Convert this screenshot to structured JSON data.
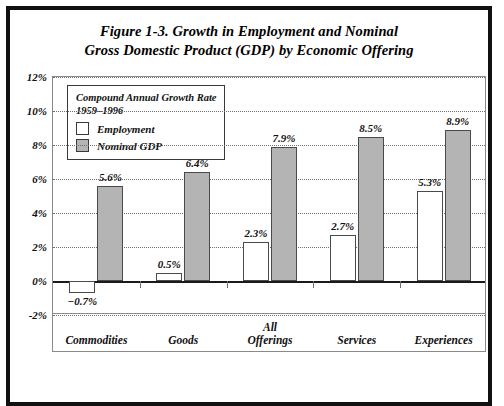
{
  "figure": {
    "title_line1": "Figure 1-3. Growth in Employment and Nominal",
    "title_line2": "Gross Domestic Product (GDP) by Economic Offering"
  },
  "legend": {
    "title_line1": "Compound Annual Growth Rate",
    "title_line2": "1959–1996",
    "entries": [
      {
        "label": "Employment",
        "swatch": "white"
      },
      {
        "label": "Nominal GDP",
        "swatch": "gray"
      }
    ]
  },
  "colors": {
    "employment_fill": "#ffffff",
    "gdp_fill": "#b4b4b4",
    "bar_outline": "#4a4a4a",
    "gridline": "#6f6f6f",
    "axis": "#1a1a1a",
    "frame": "#111111",
    "text": "#111111"
  },
  "chart_data": {
    "type": "bar",
    "title": "Figure 1-3. Growth in Employment and Nominal Gross Domestic Product (GDP) by Economic Offering",
    "subtitle": "Compound Annual Growth Rate 1959–1996",
    "xlabel": "",
    "ylabel": "",
    "ylim": [
      -2,
      12
    ],
    "ytick_step": 2,
    "yticks": [
      "12%",
      "10%",
      "8%",
      "6%",
      "4%",
      "2%",
      "0%",
      "-2%"
    ],
    "ytick_values": [
      12,
      10,
      8,
      6,
      4,
      2,
      0,
      -2
    ],
    "grid": "horizontal-dotted",
    "legend_position": "inside-top-left",
    "categories": [
      "Commodities",
      "Goods",
      "All Offerings",
      "Services",
      "Experiences"
    ],
    "category_lines": [
      [
        "Commodities"
      ],
      [
        "Goods"
      ],
      [
        "All",
        "Offerings"
      ],
      [
        "Services"
      ],
      [
        "Experiences"
      ]
    ],
    "series": [
      {
        "name": "Employment",
        "values": [
          -0.7,
          0.5,
          2.3,
          2.7,
          5.3
        ],
        "labels": [
          "−0.7%",
          "0.5%",
          "2.3%",
          "2.7%",
          "5.3%"
        ]
      },
      {
        "name": "Nominal GDP",
        "values": [
          5.6,
          6.4,
          7.9,
          8.5,
          8.9
        ],
        "labels": [
          "5.6%",
          "6.4%",
          "7.9%",
          "8.5%",
          "8.9%"
        ]
      }
    ]
  }
}
